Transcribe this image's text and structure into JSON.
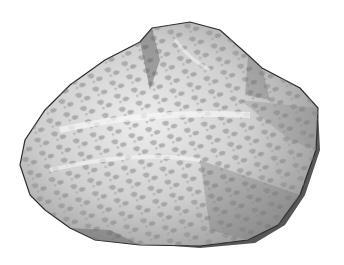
{
  "image": {
    "subject": "pencil drawing of a rock",
    "background_color": "#ffffff",
    "palette": {
      "outline": "#2a2a2a",
      "shadow": "#555555",
      "mid": "#8c8c8c",
      "light": "#c8c8c8",
      "highlight": "#f2f2f2"
    }
  }
}
